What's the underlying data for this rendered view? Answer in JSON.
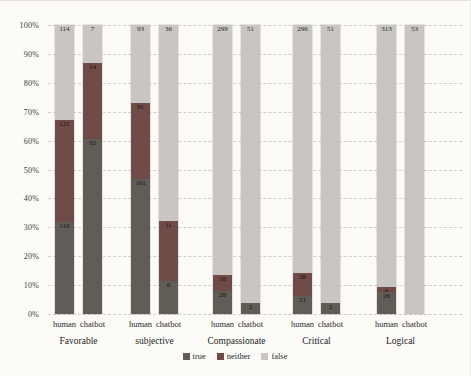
{
  "chart_data": {
    "type": "bar",
    "subtype": "percent-stacked-column",
    "title": "",
    "xlabel": "",
    "ylabel": "",
    "ylim": [
      0,
      100
    ],
    "grid": true,
    "legend_position": "bottom",
    "yticks": [
      "100%",
      "90%",
      "80%",
      "70%",
      "60%",
      "50%",
      "40%",
      "30%",
      "20%",
      "10%",
      "0%"
    ],
    "series_order_top_to_bottom": [
      "false",
      "neither",
      "true"
    ],
    "colors": {
      "true": "#625c57",
      "neither": "#6f4a46",
      "false": "#c9c6c1"
    },
    "legend": [
      "true",
      "neither",
      "false"
    ],
    "groups": [
      {
        "category": "Favorable",
        "bars": [
          {
            "label": "human",
            "values": {
              "true": 110,
              "neither": 121,
              "false": 114
            }
          },
          {
            "label": "chatbot",
            "values": {
              "true": 32,
              "neither": 14,
              "false": 7
            }
          }
        ]
      },
      {
        "category": "subjective",
        "bars": [
          {
            "label": "human",
            "values": {
              "true": 161,
              "neither": 91,
              "false": 93
            }
          },
          {
            "label": "chatbot",
            "values": {
              "true": 6,
              "neither": 11,
              "false": 36
            }
          }
        ]
      },
      {
        "category": "Compassionate",
        "bars": [
          {
            "label": "human",
            "values": {
              "true": 28,
              "neither": 18,
              "false": 299
            }
          },
          {
            "label": "chatbot",
            "values": {
              "true": 2,
              "neither": 0,
              "false": 51
            }
          }
        ]
      },
      {
        "category": "Critical",
        "bars": [
          {
            "label": "human",
            "values": {
              "true": 21,
              "neither": 28,
              "false": 296
            }
          },
          {
            "label": "chatbot",
            "values": {
              "true": 2,
              "neither": 0,
              "false": 51
            }
          }
        ]
      },
      {
        "category": "Logical",
        "bars": [
          {
            "label": "human",
            "values": {
              "true": 26,
              "neither": 6,
              "false": 313
            }
          },
          {
            "label": "chatbot",
            "values": {
              "true": 0,
              "neither": 0,
              "false": 53
            }
          }
        ]
      }
    ]
  }
}
